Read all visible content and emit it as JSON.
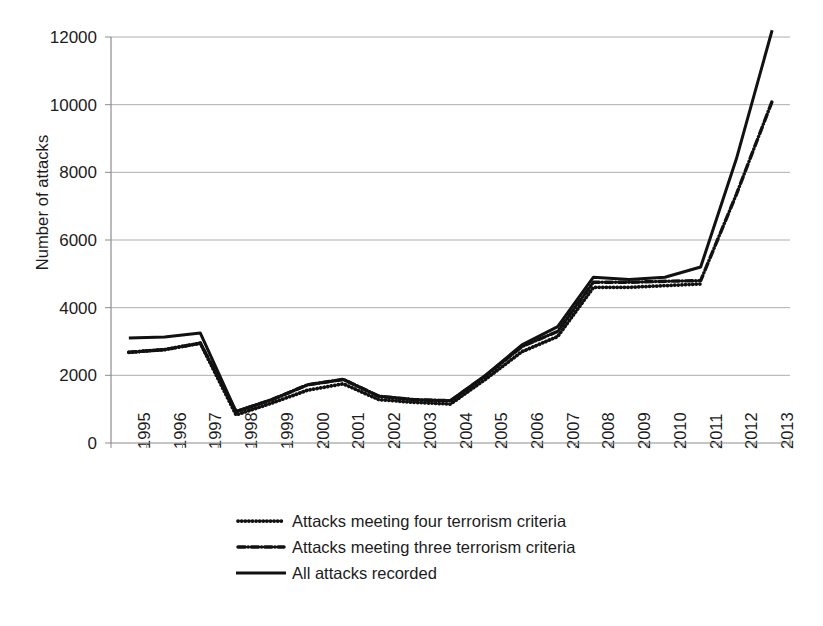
{
  "chart_data": {
    "type": "line",
    "title": "",
    "xlabel": "",
    "ylabel": "Number of attacks",
    "ylim": [
      0,
      12000
    ],
    "yticks": [
      0,
      2000,
      4000,
      6000,
      8000,
      10000,
      12000
    ],
    "ytick_labels": [
      "0",
      "2000",
      "4000",
      "6000",
      "8000",
      "10000",
      "12000"
    ],
    "grid": "horizontal",
    "legend_position": "below-center",
    "categories": [
      "1995",
      "1996",
      "1997",
      "1998",
      "1999",
      "2000",
      "2001",
      "2002",
      "2003",
      "2004",
      "2005",
      "2006",
      "2007",
      "2008",
      "2009",
      "2010",
      "2011",
      "2012",
      "2013"
    ],
    "series": [
      {
        "name": "Attacks meeting four terrorism criteria",
        "style": "dotted",
        "color": "#111111",
        "values": [
          2680,
          2760,
          2950,
          830,
          1180,
          1560,
          1750,
          1280,
          1200,
          1150,
          1900,
          2700,
          3150,
          4600,
          4600,
          4650,
          4700,
          null,
          null
        ]
      },
      {
        "name": "Attacks meeting three terrorism criteria",
        "style": "dash-dot",
        "color": "#111111",
        "values": [
          2680,
          2760,
          2950,
          930,
          1280,
          1720,
          1880,
          1380,
          1280,
          1250,
          2000,
          2850,
          3300,
          4750,
          4750,
          4780,
          4800,
          7350,
          10100
        ]
      },
      {
        "name": "All attacks recorded",
        "style": "solid",
        "color": "#111111",
        "values": [
          3100,
          3130,
          3250,
          930,
          1280,
          1720,
          1880,
          1380,
          1280,
          1250,
          2020,
          2900,
          3440,
          4900,
          4830,
          4900,
          5200,
          8400,
          12200
        ]
      }
    ]
  },
  "axis": {
    "y_title": "Number of attacks"
  },
  "legend": {
    "items": [
      {
        "label": "Attacks meeting four terrorism criteria",
        "key": "dotted-line-key"
      },
      {
        "label": "Attacks meeting three terrorism criteria",
        "key": "dash-dot-line-key"
      },
      {
        "label": "All attacks recorded",
        "key": "solid-line-key"
      }
    ]
  }
}
